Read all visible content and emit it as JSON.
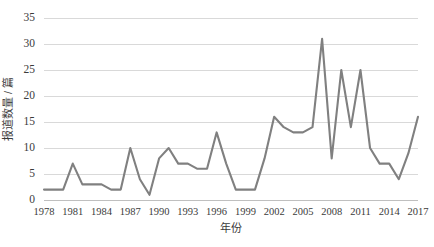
{
  "chart_data": {
    "type": "line",
    "title": "",
    "xlabel": "年份",
    "ylabel": "报道数量 / 篇",
    "xlim": [
      1978,
      2017
    ],
    "ylim": [
      0,
      35
    ],
    "grid": true,
    "legend": false,
    "legend_position": "none",
    "line_color": "#808080",
    "gridline_color": "#d9d9d9",
    "axis_color": "#bfbfbf",
    "background_color": "#ffffff",
    "yticks": [
      0,
      5,
      10,
      15,
      20,
      25,
      30,
      35
    ],
    "ytick_labels": [
      "0",
      "5",
      "10",
      "15",
      "20",
      "25",
      "30",
      "35"
    ],
    "xticks": [
      1978,
      1981,
      1984,
      1987,
      1990,
      1993,
      1996,
      1999,
      2002,
      2005,
      2008,
      2011,
      2014,
      2017
    ],
    "xtick_labels": [
      "1978",
      "1981",
      "1984",
      "1987",
      "1990",
      "1993",
      "1996",
      "1999",
      "2002",
      "2005",
      "2008",
      "2011",
      "2014",
      "2017"
    ],
    "x": [
      1978,
      1979,
      1980,
      1981,
      1982,
      1983,
      1984,
      1985,
      1986,
      1987,
      1988,
      1989,
      1990,
      1991,
      1992,
      1993,
      1994,
      1995,
      1996,
      1997,
      1998,
      1999,
      2000,
      2001,
      2002,
      2003,
      2004,
      2005,
      2006,
      2007,
      2008,
      2009,
      2010,
      2011,
      2012,
      2013,
      2014,
      2015,
      2016,
      2017
    ],
    "values": [
      2,
      2,
      2,
      7,
      3,
      3,
      3,
      2,
      2,
      10,
      4,
      1,
      8,
      10,
      7,
      7,
      6,
      6,
      13,
      7,
      2,
      2,
      2,
      8,
      16,
      14,
      13,
      13,
      14,
      31,
      8,
      25,
      14,
      25,
      10,
      7,
      7,
      4,
      9,
      16
    ],
    "series": [
      {
        "name": "报道数量",
        "color": "#808080",
        "values": [
          2,
          2,
          2,
          7,
          3,
          3,
          3,
          2,
          2,
          10,
          4,
          1,
          8,
          10,
          7,
          7,
          6,
          6,
          13,
          7,
          2,
          2,
          2,
          8,
          16,
          14,
          13,
          13,
          14,
          31,
          8,
          25,
          14,
          25,
          10,
          7,
          7,
          4,
          9,
          16
        ]
      }
    ]
  }
}
